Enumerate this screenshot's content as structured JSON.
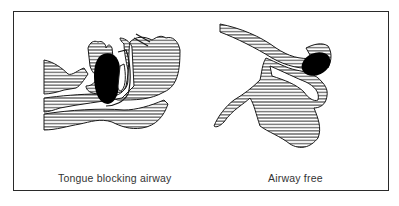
{
  "figure": {
    "panels": [
      {
        "id": "left",
        "caption": "Tongue blocking airway"
      },
      {
        "id": "right",
        "caption": "Airway free"
      }
    ],
    "colors": {
      "ink": "#1a1a1a",
      "frame": "#2a2a2a",
      "background": "#ffffff",
      "tongue": "#000000"
    }
  }
}
